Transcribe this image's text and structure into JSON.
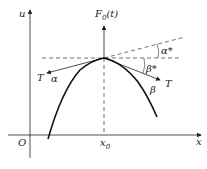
{
  "diagram": {
    "axis_y_label": "u",
    "axis_x_label": "x",
    "origin_label": "O",
    "peak_x_label": "x",
    "peak_x_sub": "0",
    "func_label": "F",
    "func_sub": "0",
    "func_arg": "(t)",
    "left_tangent_label": "T",
    "right_tangent_label": "T",
    "alpha": "α",
    "beta": "β",
    "alpha_star": "α*",
    "beta_star": "β*"
  },
  "colors": {
    "stroke": "#222222",
    "background": "#ffffff"
  }
}
